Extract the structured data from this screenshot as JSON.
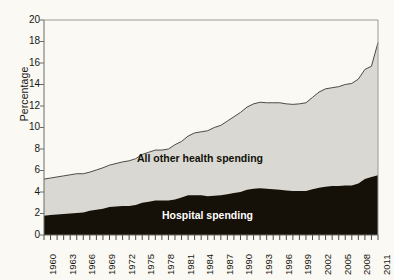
{
  "chart_data": {
    "type": "area",
    "stacked": true,
    "title": "",
    "subtitle": "",
    "xlabel": "",
    "ylabel": "Percentage",
    "ylim": [
      0,
      20
    ],
    "ytick_step": 2,
    "yticks": [
      0,
      2,
      4,
      6,
      8,
      10,
      12,
      14,
      16,
      18,
      20
    ],
    "xlim": [
      1960,
      2011
    ],
    "xtick_labels": [
      "1960",
      "1963",
      "1966",
      "1969",
      "1972",
      "1975",
      "1978",
      "1981",
      "1984",
      "1987",
      "1990",
      "1993",
      "1996",
      "1999",
      "2002",
      "2005",
      "2008",
      "2011"
    ],
    "minor_ticks": "every year 1960-2011",
    "grid": false,
    "legend_position": "inline-annotations",
    "annotations": [
      "All other health spending",
      "Hospital spending"
    ],
    "x": [
      1960,
      1961,
      1962,
      1963,
      1964,
      1965,
      1966,
      1967,
      1968,
      1969,
      1970,
      1971,
      1972,
      1973,
      1974,
      1975,
      1976,
      1977,
      1978,
      1979,
      1980,
      1981,
      1982,
      1983,
      1984,
      1985,
      1986,
      1987,
      1988,
      1989,
      1990,
      1991,
      1992,
      1993,
      1994,
      1995,
      1996,
      1997,
      1998,
      1999,
      2000,
      2001,
      2002,
      2003,
      2004,
      2005,
      2006,
      2007,
      2008,
      2009,
      2010,
      2011
    ],
    "series": [
      {
        "name": "Hospital spending",
        "color": "#151008",
        "values": [
          1.8,
          1.85,
          1.9,
          1.95,
          2.0,
          2.05,
          2.1,
          2.25,
          2.35,
          2.45,
          2.6,
          2.65,
          2.7,
          2.7,
          2.8,
          3.0,
          3.1,
          3.2,
          3.2,
          3.2,
          3.3,
          3.5,
          3.7,
          3.7,
          3.7,
          3.6,
          3.65,
          3.7,
          3.8,
          3.9,
          4.0,
          4.2,
          4.3,
          4.35,
          4.3,
          4.25,
          4.2,
          4.15,
          4.1,
          4.1,
          4.1,
          4.25,
          4.4,
          4.5,
          4.55,
          4.55,
          4.6,
          4.6,
          4.8,
          5.2,
          5.4,
          5.55
        ]
      },
      {
        "name": "All other health spending",
        "color": "#d9d8d2",
        "values": [
          3.4,
          3.45,
          3.5,
          3.55,
          3.6,
          3.65,
          3.6,
          3.6,
          3.7,
          3.8,
          3.9,
          4.0,
          4.1,
          4.2,
          4.3,
          4.5,
          4.6,
          4.7,
          4.7,
          4.8,
          5.1,
          5.2,
          5.5,
          5.8,
          5.9,
          6.1,
          6.35,
          6.5,
          6.8,
          7.1,
          7.4,
          7.7,
          7.9,
          8.0,
          8.0,
          8.05,
          8.1,
          8.05,
          8.05,
          8.1,
          8.2,
          8.55,
          8.9,
          9.1,
          9.15,
          9.25,
          9.4,
          9.5,
          9.7,
          10.2,
          10.3,
          12.35
        ]
      }
    ],
    "total_values": [
      5.2,
      5.3,
      5.4,
      5.5,
      5.6,
      5.7,
      5.7,
      5.85,
      6.05,
      6.25,
      6.5,
      6.65,
      6.8,
      6.9,
      7.1,
      7.5,
      7.7,
      7.9,
      7.9,
      8.0,
      8.4,
      8.7,
      9.2,
      9.5,
      9.6,
      9.7,
      10.0,
      10.2,
      10.6,
      11.0,
      11.4,
      11.9,
      12.2,
      12.35,
      12.3,
      12.3,
      12.3,
      12.2,
      12.15,
      12.2,
      12.3,
      12.8,
      13.3,
      13.6,
      13.7,
      13.8,
      14.0,
      14.1,
      14.5,
      15.4,
      15.7,
      17.9
    ]
  },
  "chart": {
    "ylabel": "Percentage",
    "label_other": "All other health spending",
    "label_hospital": "Hospital spending",
    "ytick_0": "0",
    "ytick_2": "2",
    "ytick_4": "4",
    "ytick_6": "6",
    "ytick_8": "8",
    "ytick_10": "10",
    "ytick_12": "12",
    "ytick_14": "14",
    "ytick_16": "16",
    "ytick_18": "18",
    "ytick_20": "20",
    "colors": {
      "hospital": "#151008",
      "other": "#d9d8d2",
      "axis": "#6d6d66",
      "background": "#fbf9f4",
      "text": "#17170f"
    }
  }
}
